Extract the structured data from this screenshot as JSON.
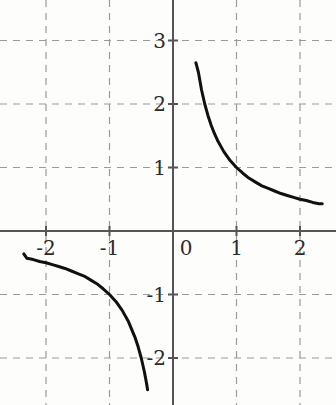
{
  "figure": {
    "background_color": "#fdfdfb",
    "width": 336,
    "height": 405
  },
  "axes": {
    "color": "#555555",
    "x_axis_name": "x-axis",
    "y_axis_name": "y-axis",
    "origin_px": {
      "x": 173,
      "y": 231
    },
    "unit_px": 63.5,
    "x_tick_labels": [
      "-2",
      "-1",
      "0",
      "1",
      "2"
    ],
    "x_tick_values": [
      -2,
      -1,
      0,
      1,
      2
    ],
    "y_tick_labels": [
      "3",
      "2",
      "1",
      "-1",
      "-2"
    ],
    "y_tick_values": [
      3,
      2,
      1,
      -1,
      -2
    ]
  },
  "grid": {
    "color": "#9a9a9a",
    "style": "dashed",
    "visible": true,
    "x_gridlines": [
      -2,
      -1,
      1,
      2
    ],
    "y_gridlines": [
      3,
      2,
      1,
      -1,
      -2
    ]
  },
  "chart_data": {
    "type": "line",
    "title": "",
    "subtitle": "",
    "xlabel": "",
    "ylabel": "",
    "xlim": [
      -2.72,
      2.57
    ],
    "ylim": [
      -2.74,
      3.64
    ],
    "grid": true,
    "legend_position": "none",
    "curve_color": "#101010",
    "curve_width": 3,
    "function": "y = 1/x",
    "series": [
      {
        "name": "branch-upper-right",
        "x": [
          0.36,
          0.4,
          0.45,
          0.5,
          0.55,
          0.6,
          0.65,
          0.7,
          0.8,
          0.9,
          1.0,
          1.1,
          1.2,
          1.3,
          1.4,
          1.5,
          1.6,
          1.7,
          1.8,
          1.9,
          2.0,
          2.1,
          2.2,
          2.3,
          2.35
        ],
        "y": [
          2.65,
          2.5,
          2.22,
          2.0,
          1.82,
          1.67,
          1.54,
          1.43,
          1.25,
          1.11,
          1.0,
          0.91,
          0.83,
          0.77,
          0.71,
          0.67,
          0.63,
          0.59,
          0.56,
          0.53,
          0.5,
          0.48,
          0.45,
          0.43,
          0.43
        ]
      },
      {
        "name": "branch-lower-left",
        "x": [
          -2.35,
          -2.3,
          -2.2,
          -2.1,
          -2.0,
          -1.9,
          -1.8,
          -1.7,
          -1.6,
          -1.5,
          -1.4,
          -1.3,
          -1.2,
          -1.1,
          -1.0,
          -0.9,
          -0.8,
          -0.7,
          -0.6,
          -0.55,
          -0.5,
          -0.45,
          -0.42,
          -0.4
        ],
        "y": [
          -0.36,
          -0.43,
          -0.45,
          -0.48,
          -0.5,
          -0.53,
          -0.56,
          -0.59,
          -0.63,
          -0.67,
          -0.71,
          -0.77,
          -0.83,
          -0.91,
          -1.0,
          -1.11,
          -1.25,
          -1.43,
          -1.67,
          -1.82,
          -2.0,
          -2.22,
          -2.38,
          -2.5
        ]
      }
    ]
  }
}
